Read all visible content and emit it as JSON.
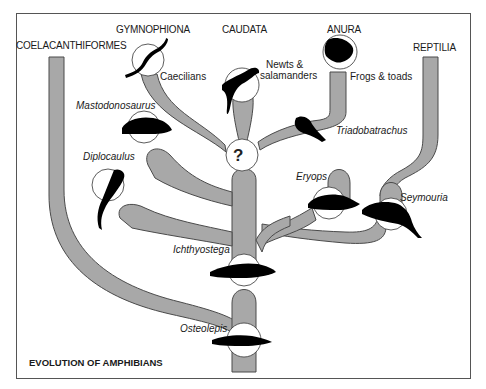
{
  "title": "EVOLUTION OF AMPHIBIANS",
  "groups": {
    "coelacanthiformes": "COELACANTHIFORMES",
    "gymnophiona": "GYMNOPHIONA",
    "caudata": "CAUDATA",
    "anura": "ANURA",
    "reptilia": "REPTILIA"
  },
  "common_names": {
    "caecilians": "Caecilians",
    "newts_salamanders_1": "Newts &",
    "newts_salamanders_2": "salamanders",
    "frogs_toads": "Frogs & toads"
  },
  "species": {
    "mastodonosaurus": "Mastodonosaurus",
    "diplocaulus": "Diplocaulus",
    "triadobatrachus": "Triadobatrachus",
    "eryops": "Eryops",
    "seymouria": "Seymouria",
    "ichthyostega": "Ichthyostega",
    "osteolepis": "Osteolepis"
  },
  "unknown_ancestor_symbol": "?",
  "colors": {
    "branch_fill": "#a8a8a8",
    "branch_stroke": "#4a4a4a",
    "silhouette": "#000000",
    "circle_fill": "#ffffff",
    "frame": "#555555"
  }
}
